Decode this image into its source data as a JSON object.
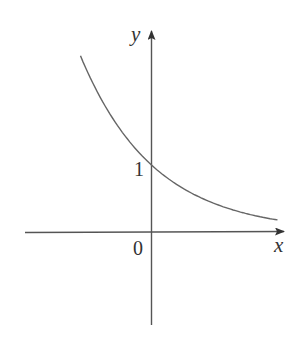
{
  "chart_data": {
    "type": "line",
    "title": "",
    "xlabel": "x",
    "ylabel": "y",
    "tick_labels": {
      "origin": "0",
      "y_intercept": "1"
    },
    "grid": false,
    "legend": null,
    "series": [
      {
        "name": "decreasing exponential y = a^x (0 < a < 1)",
        "points": [
          {
            "x": -1.06,
            "y": 2.9
          },
          {
            "x": -0.75,
            "y": 2.1
          },
          {
            "x": -0.5,
            "y": 1.6
          },
          {
            "x": -0.25,
            "y": 1.3
          },
          {
            "x": 0,
            "y": 1
          },
          {
            "x": 0.5,
            "y": 0.66
          },
          {
            "x": 1.0,
            "y": 0.45
          },
          {
            "x": 1.5,
            "y": 0.3
          },
          {
            "x": 1.88,
            "y": 0.18
          }
        ],
        "color": "#555555"
      }
    ],
    "xlim": [
      -1.9,
      2.0
    ],
    "ylim": [
      -1.4,
      3.0
    ],
    "annotations": [
      "y-intercept at (0, 1)",
      "curve approaches x-axis as x increases"
    ]
  },
  "colors": {
    "axis": "#555555",
    "curve": "#666666",
    "text": "#333333",
    "background": "#ffffff"
  }
}
